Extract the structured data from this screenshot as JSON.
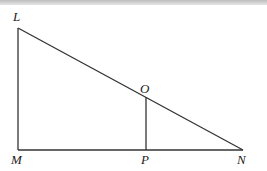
{
  "diagram": {
    "type": "geometry-right-triangle",
    "points": {
      "L": {
        "label": "L",
        "x": 18,
        "y": 28
      },
      "M": {
        "label": "M",
        "x": 18,
        "y": 150
      },
      "N": {
        "label": "N",
        "x": 243,
        "y": 150
      },
      "O": {
        "label": "O",
        "x": 146,
        "y": 97
      },
      "P": {
        "label": "P",
        "x": 146,
        "y": 150
      }
    },
    "segments": [
      [
        "L",
        "M"
      ],
      [
        "M",
        "N"
      ],
      [
        "L",
        "N"
      ],
      [
        "O",
        "P"
      ]
    ],
    "stroke_color": "#333333"
  }
}
